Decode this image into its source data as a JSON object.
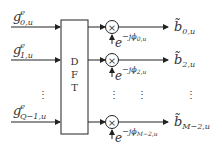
{
  "diagram": {
    "block": {
      "label_lines": [
        "D",
        "F",
        "T"
      ]
    },
    "inputs": [
      {
        "base": "g",
        "sup": "e",
        "sub": "0,u"
      },
      {
        "base": "g",
        "sup": "e",
        "sub": "1,u"
      },
      {
        "base": "g",
        "sup": "e",
        "sub": "Q−1,u"
      }
    ],
    "multipliers": [
      {
        "symbol": "×",
        "phase": "−jϕ",
        "phase_sub": "0,u"
      },
      {
        "symbol": "×",
        "phase": "−jϕ",
        "phase_sub": "2,u"
      },
      {
        "symbol": "×",
        "phase": "−jϕ",
        "phase_sub": "M−2,u"
      }
    ],
    "outputs": [
      {
        "base": "b̃",
        "sub": "0,u"
      },
      {
        "base": "b̃",
        "sub": "2,u"
      },
      {
        "base": "b̃",
        "sub": "M−2,u"
      }
    ],
    "exp_base": "e",
    "ellipsis": "⋮"
  }
}
